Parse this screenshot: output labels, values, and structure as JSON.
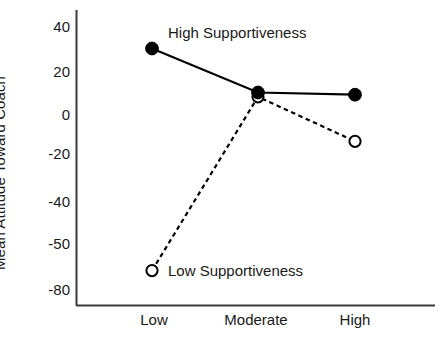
{
  "chart_data": {
    "type": "line",
    "title": "",
    "xlabel": "",
    "ylabel": "Mean Attitude Toward Coach",
    "categories": [
      "Low",
      "Moderate",
      "High"
    ],
    "ytick_labels": [
      "40",
      "20",
      "0",
      "-20",
      "-40",
      "-50",
      "-80"
    ],
    "ytick_values": [
      40,
      20,
      0,
      -20,
      -40,
      -50,
      -80
    ],
    "ylim": [
      -80,
      48
    ],
    "grid": false,
    "legend_position": "inline-annotations",
    "series": [
      {
        "name": "High Supportiveness",
        "values": [
          30,
          10,
          9
        ],
        "marker": "filled-circle",
        "line_style": "solid",
        "color": "#000000"
      },
      {
        "name": "Low Supportiveness",
        "values": [
          -68,
          8,
          -14
        ],
        "marker": "open-circle",
        "line_style": "dashed",
        "color": "#000000"
      }
    ],
    "annotations": [
      {
        "text": "High Supportiveness",
        "series": "High Supportiveness"
      },
      {
        "text": "Low Supportiveness",
        "series": "Low Supportiveness"
      }
    ]
  },
  "axes": {
    "x_categories": [
      {
        "label": "Low"
      },
      {
        "label": "Moderate"
      },
      {
        "label": "High"
      }
    ],
    "y_ticks": [
      {
        "label": "40"
      },
      {
        "label": "20"
      },
      {
        "label": "0"
      },
      {
        "label": "-20"
      },
      {
        "label": "-40"
      },
      {
        "label": "-50"
      },
      {
        "label": "-80"
      }
    ],
    "y_title": "Mean Attitude Toward Coach"
  },
  "labels": {
    "high_supportiveness": "High Supportiveness",
    "low_supportiveness": "Low Supportiveness"
  },
  "colors": {
    "ink": "#000000",
    "axis": "#3a3a3a",
    "background": "#ffffff"
  }
}
